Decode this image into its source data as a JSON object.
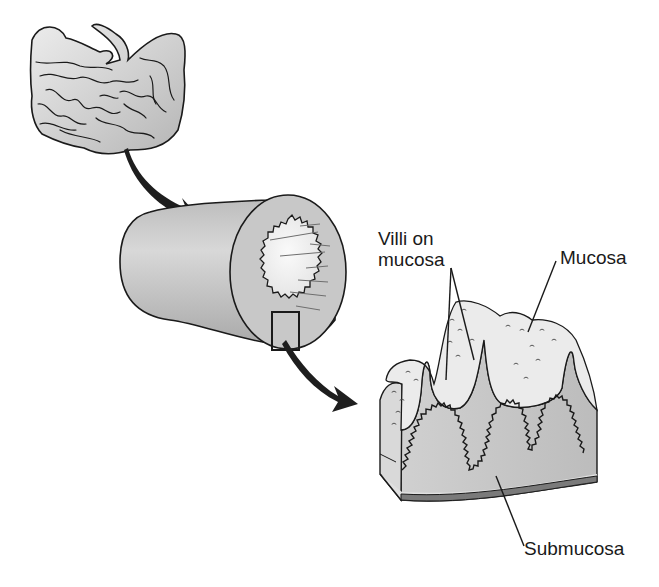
{
  "figure": {
    "type": "anatomical-illustration",
    "panels": [
      {
        "id": "intestine-overview",
        "description": "Coiled small intestine"
      },
      {
        "id": "intestine-tube",
        "description": "Cross-section of intestinal tube with highlighted region"
      },
      {
        "id": "wall-detail",
        "description": "Magnified block of intestinal wall with villi"
      }
    ],
    "labels": {
      "villi_line1": "Villi on",
      "villi_line2": "mucosa",
      "mucosa": "Mucosa",
      "submucosa": "Submucosa"
    },
    "colors": {
      "background": "#ffffff",
      "outline": "#1a1a1a",
      "tissue_light": "#e6e6e6",
      "tissue_mid": "#cfcfcf",
      "tissue_dark": "#a8a8a8",
      "arrow": "#1e1e1e",
      "base_band": "#7a7a7a"
    }
  }
}
